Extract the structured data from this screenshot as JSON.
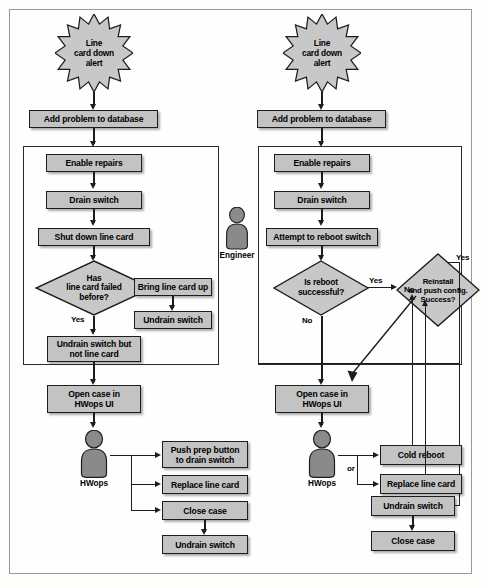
{
  "diagram": {
    "colors": {
      "box_fill": "#c3c3c3",
      "box_stroke": "#1d1d1d",
      "frame_stroke": "#9a9a96",
      "actor_fill": "#8a8a8a",
      "page_bg": "#fefefe"
    }
  },
  "left_flow": {
    "start": "Line\ncard down\nalert",
    "start_line1": "Line",
    "start_line2": "card down",
    "start_line3": "alert",
    "add_problem": "Add problem to database",
    "enable_repairs": "Enable repairs",
    "drain_switch": "Drain switch",
    "shut_down": "Shut down line card",
    "decision_line1": "Has",
    "decision_line2": "line card failed",
    "decision_line3": "before?",
    "branch_no": "No",
    "branch_yes": "Yes",
    "bring_up": "Bring line card up",
    "undrain_switch": "Undrain switch",
    "undrain_not_card_line1": "Undrain switch but",
    "undrain_not_card_line2": "not line card",
    "open_case_line1": "Open case in",
    "open_case_line2": "HWops UI",
    "actor": "HWops",
    "push_prep_line1": "Push prep button",
    "push_prep_line2": "to drain switch",
    "replace_card": "Replace line card",
    "close_case": "Close case",
    "final_undrain": "Undrain switch"
  },
  "center": {
    "actor": "Engineer"
  },
  "right_flow": {
    "start_line1": "Line",
    "start_line2": "card down",
    "start_line3": "alert",
    "add_problem": "Add problem to database",
    "enable_repairs": "Enable repairs",
    "drain_switch": "Drain switch",
    "attempt_reboot": "Attempt to reboot switch",
    "decision1_line1": "Is reboot",
    "decision1_line2": "successful?",
    "decision1_yes": "Yes",
    "decision1_no": "No",
    "decision2_line1": "Reinstall",
    "decision2_line2": "and push config.",
    "decision2_line3": "Success?",
    "decision2_yes": "Yes",
    "decision2_no": "No",
    "open_case_line1": "Open case in",
    "open_case_line2": "HWops UI",
    "actor": "HWops",
    "or_label": "or",
    "cold_reboot": "Cold reboot",
    "replace_card": "Replace line card",
    "undrain_switch": "Undrain switch",
    "close_case": "Close case"
  }
}
